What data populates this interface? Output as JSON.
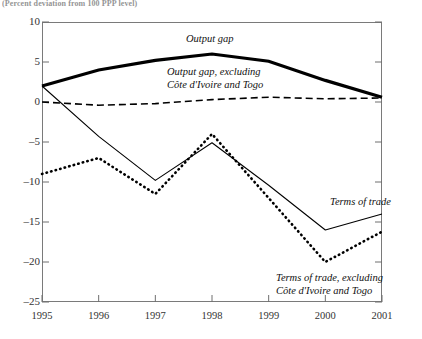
{
  "figure": {
    "top_note": "(Percent deviation from 100 PPP level)"
  },
  "chart_data": {
    "type": "line",
    "title": "",
    "xlabel": "",
    "ylabel": "",
    "categories": [
      "1995",
      "1996",
      "1997",
      "1998",
      "1999",
      "2000",
      "2001"
    ],
    "x": [
      1995,
      1996,
      1997,
      1998,
      1999,
      2000,
      2001
    ],
    "xlim": [
      1995,
      2001
    ],
    "ylim": [
      -25,
      10
    ],
    "yticks": [
      10,
      5,
      0,
      -5,
      -10,
      -15,
      -20,
      -25
    ],
    "ytick_labels": [
      "10",
      "5",
      "0",
      "–5",
      "–10",
      "–15",
      "–20",
      "–25"
    ],
    "xticks": [
      1995,
      1996,
      1997,
      1998,
      1999,
      2000,
      2001
    ],
    "grid": false,
    "legend": "inline-annotations",
    "series": [
      {
        "name": "Output gap",
        "style": "thick-solid",
        "color": "#000000",
        "width": 3.2,
        "values": [
          2.0,
          4.0,
          5.2,
          6.0,
          5.1,
          2.7,
          0.6
        ]
      },
      {
        "name": "Output gap, excluding Côte d'Ivoire and Togo",
        "style": "dashed",
        "color": "#000000",
        "width": 1.6,
        "values": [
          0.0,
          -0.4,
          -0.2,
          0.3,
          0.6,
          0.4,
          0.5
        ]
      },
      {
        "name": "Terms of trade",
        "style": "thin-solid",
        "color": "#000000",
        "width": 1.1,
        "values": [
          2.0,
          -4.3,
          -9.8,
          -5.1,
          -10.4,
          -16.0,
          -14.0
        ]
      },
      {
        "name": "Terms of trade, excluding Côte d'Ivoire and Togo",
        "style": "dotted",
        "color": "#000000",
        "width": 2.6,
        "values": [
          -9.0,
          -7.0,
          -11.5,
          -4.0,
          -12.0,
          -20.0,
          -16.2
        ]
      }
    ],
    "annotations": [
      {
        "text": "Output gap",
        "series": "Output gap"
      },
      {
        "text": "Output gap, excluding\nCôte d'Ivoire and Togo",
        "series": "Output gap, excluding Côte d'Ivoire and Togo"
      },
      {
        "text": "Terms of trade",
        "series": "Terms of trade"
      },
      {
        "text": "Terms of trade, excluding\nCôte d'Ivoire and Togo",
        "series": "Terms of trade, excluding Côte d'Ivoire and Togo"
      }
    ]
  }
}
